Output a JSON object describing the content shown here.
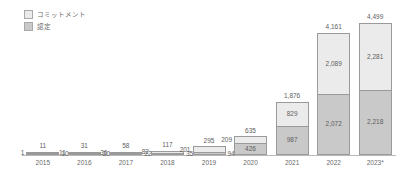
{
  "chart_data": {
    "type": "bar",
    "title": "",
    "subtitle": "",
    "xlabel": "",
    "ylabel": "",
    "stacked": true,
    "grid": false,
    "legend_position": "top-left",
    "ylim": [
      0,
      4700
    ],
    "categories": [
      "2015",
      "2016",
      "2017",
      "2018",
      "2019",
      "2020",
      "2021",
      "2022",
      "2023*"
    ],
    "series": [
      {
        "name": "コミットメント",
        "color": "#ebebeb",
        "values": [
          1,
          11,
          36,
          82,
          201,
          209,
          829,
          2089,
          2281
        ],
        "labels": [
          "1",
          "11",
          "36",
          "82",
          "201",
          "209",
          "829",
          "2,089",
          "2,281"
        ]
      },
      {
        "name": "認定",
        "color": "#c9c9c9",
        "values": [
          10,
          20,
          22,
          35,
          94,
          426,
          987,
          2072,
          2218
        ],
        "labels": [
          "10",
          "20",
          "22",
          "35",
          "94",
          "426",
          "987",
          "2,072",
          "2,218"
        ]
      }
    ],
    "totals": [
      11,
      31,
      58,
      117,
      295,
      635,
      1876,
      4161,
      4499
    ],
    "total_labels": [
      "11",
      "31",
      "58",
      "117",
      "295",
      "635",
      "1,876",
      "4,161",
      "4,499"
    ]
  },
  "legend": {
    "items": [
      {
        "label": "コミットメント",
        "swatch": "#ebebeb"
      },
      {
        "label": "認定",
        "swatch": "#c9c9c9"
      }
    ]
  },
  "axis": {
    "ticks": [
      "2015",
      "2016",
      "2017",
      "2018",
      "2019",
      "2020",
      "2021",
      "2022",
      "2023*"
    ]
  },
  "colors": {
    "commitment": "#ebebeb",
    "certification": "#c9c9c9",
    "border": "#9a9a9a",
    "axis": "#b9b9b9",
    "text": "#6a6a6a"
  }
}
